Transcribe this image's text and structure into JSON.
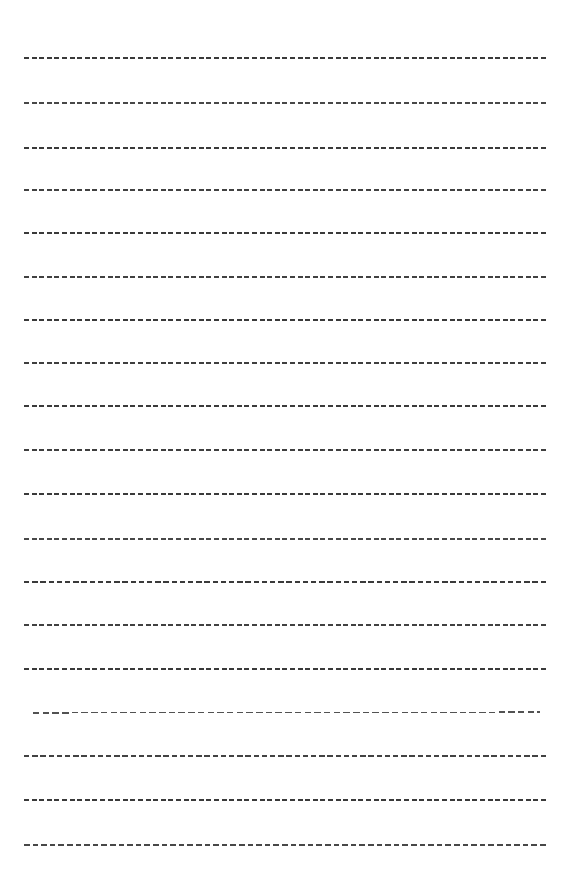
{
  "document": {
    "kind": "lined-writing-paper",
    "title": "Lined Writing Paper Sheet",
    "page_width": 569,
    "page_height": 886,
    "background_color": "#ffffff",
    "visible_text": "",
    "rule_count": 19
  },
  "rules": {
    "style": {
      "stroke_color": "#2f2f2f",
      "stroke_width": 1.15,
      "dash_length": 5,
      "gap_length": 2.6,
      "default_x_start": 24,
      "default_x_end": 546
    },
    "lines": [
      {
        "index": 1,
        "y": 58,
        "x1": 24,
        "x2": 546,
        "dash": 5,
        "gap": 2.6,
        "opacity": 0.95,
        "tilt": 0.0,
        "color": "#2f2f2f"
      },
      {
        "index": 2,
        "y": 103,
        "x1": 24,
        "x2": 546,
        "dash": 5,
        "gap": 2.6,
        "opacity": 0.9,
        "tilt": 0.0,
        "color": "#343434"
      },
      {
        "index": 3,
        "y": 148,
        "x1": 24,
        "x2": 546,
        "dash": 5,
        "gap": 2.6,
        "opacity": 0.95,
        "tilt": 0.0,
        "color": "#2f2f2f"
      },
      {
        "index": 4,
        "y": 190,
        "x1": 24,
        "x2": 546,
        "dash": 5,
        "gap": 2.6,
        "opacity": 0.92,
        "tilt": 0.0,
        "color": "#323232"
      },
      {
        "index": 5,
        "y": 233,
        "x1": 24,
        "x2": 546,
        "dash": 5,
        "gap": 2.6,
        "opacity": 0.95,
        "tilt": 0.0,
        "color": "#2f2f2f"
      },
      {
        "index": 6,
        "y": 277,
        "x1": 24,
        "x2": 546,
        "dash": 5,
        "gap": 2.6,
        "opacity": 0.92,
        "tilt": 0.0,
        "color": "#313131"
      },
      {
        "index": 7,
        "y": 320,
        "x1": 24,
        "x2": 546,
        "dash": 5,
        "gap": 2.6,
        "opacity": 0.95,
        "tilt": 0.0,
        "color": "#2f2f2f"
      },
      {
        "index": 8,
        "y": 363,
        "x1": 24,
        "x2": 546,
        "dash": 5,
        "gap": 2.6,
        "opacity": 0.93,
        "tilt": 0.0,
        "color": "#303030"
      },
      {
        "index": 9,
        "y": 406,
        "x1": 24,
        "x2": 546,
        "dash": 5,
        "gap": 2.6,
        "opacity": 0.95,
        "tilt": 0.0,
        "color": "#2f2f2f"
      },
      {
        "index": 10,
        "y": 450,
        "x1": 24,
        "x2": 546,
        "dash": 5,
        "gap": 2.6,
        "opacity": 0.93,
        "tilt": 0.0,
        "color": "#303030"
      },
      {
        "index": 11,
        "y": 494,
        "x1": 24,
        "x2": 546,
        "dash": 5,
        "gap": 2.6,
        "opacity": 0.95,
        "tilt": 0.0,
        "color": "#2f2f2f"
      },
      {
        "index": 12,
        "y": 539,
        "x1": 24,
        "x2": 546,
        "dash": 5,
        "gap": 2.6,
        "opacity": 0.9,
        "tilt": 0.0,
        "color": "#353535"
      },
      {
        "index": 13,
        "y": 582,
        "x1": 24,
        "x2": 546,
        "dash": 5.4,
        "gap": 2.8,
        "opacity": 0.95,
        "tilt": 0.0,
        "color": "#2f2f2f"
      },
      {
        "index": 14,
        "y": 625,
        "x1": 24,
        "x2": 546,
        "dash": 5,
        "gap": 2.6,
        "opacity": 0.92,
        "tilt": 0.0,
        "color": "#313131"
      },
      {
        "index": 15,
        "y": 669,
        "x1": 24,
        "x2": 546,
        "dash": 5,
        "gap": 2.6,
        "opacity": 0.95,
        "tilt": 0.0,
        "color": "#2f2f2f"
      },
      {
        "index": 16,
        "y": 713,
        "x1": 33,
        "x2": 540,
        "dash": 6.5,
        "gap": 3.2,
        "opacity": 0.88,
        "tilt": -1.0,
        "color": "#3a3a3a"
      },
      {
        "index": 17,
        "y": 756,
        "x1": 24,
        "x2": 546,
        "dash": 5.4,
        "gap": 2.8,
        "opacity": 0.92,
        "tilt": 0.0,
        "color": "#323232"
      },
      {
        "index": 18,
        "y": 800,
        "x1": 24,
        "x2": 546,
        "dash": 5,
        "gap": 2.6,
        "opacity": 0.95,
        "tilt": 0.0,
        "color": "#2f2f2f"
      },
      {
        "index": 19,
        "y": 845,
        "x1": 24,
        "x2": 546,
        "dash": 5.6,
        "gap": 3.0,
        "opacity": 0.9,
        "tilt": 0.0,
        "color": "#343434"
      }
    ]
  }
}
